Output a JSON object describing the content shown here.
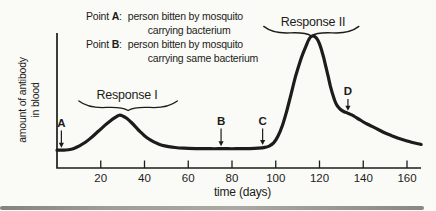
{
  "figure": {
    "background": "#fafaf6",
    "ink": "#1c1c1a"
  },
  "legend": {
    "entries": [
      {
        "prefix": "Point",
        "letter": "A",
        "suffix": ":",
        "line1": "person bitten by mosquito",
        "line2": "carrying bacterium"
      },
      {
        "prefix": "Point",
        "letter": "B",
        "suffix": ":",
        "line1": "person bitten by mosquito",
        "line2": "carrying same bacterium"
      }
    ]
  },
  "chart_data": {
    "type": "line",
    "title": "",
    "xlabel": "time (days)",
    "ylabel": "amount of antibody in blood",
    "ylabel_lines": [
      "amount of antibody",
      "in blood"
    ],
    "x_ticks": [
      20,
      40,
      60,
      80,
      100,
      120,
      140,
      160
    ],
    "xlim": [
      0,
      166
    ],
    "ylim": [
      0,
      105
    ],
    "grid": false,
    "legend_position": "none",
    "series": [
      {
        "name": "antibody level",
        "points": [
          [
            0,
            13.5
          ],
          [
            2,
            13.5
          ],
          [
            4,
            13.6
          ],
          [
            6,
            14
          ],
          [
            8,
            15
          ],
          [
            10,
            16.5
          ],
          [
            13,
            19.5
          ],
          [
            16,
            23.5
          ],
          [
            19,
            28
          ],
          [
            22,
            32.5
          ],
          [
            25,
            36.5
          ],
          [
            27,
            38.8
          ],
          [
            28.5,
            40
          ],
          [
            30,
            39.5
          ],
          [
            32,
            37.5
          ],
          [
            34,
            34.5
          ],
          [
            36,
            31
          ],
          [
            38,
            27.5
          ],
          [
            40,
            24.5
          ],
          [
            42,
            22
          ],
          [
            44,
            20
          ],
          [
            46,
            18.5
          ],
          [
            48,
            17.3
          ],
          [
            51,
            16.2
          ],
          [
            54,
            15.5
          ],
          [
            58,
            15
          ],
          [
            64,
            14.7
          ],
          [
            70,
            14.6
          ],
          [
            76,
            14.6
          ],
          [
            82,
            14.6
          ],
          [
            88,
            14.7
          ],
          [
            92,
            15
          ],
          [
            95,
            15.6
          ],
          [
            97,
            16.6
          ],
          [
            99,
            19
          ],
          [
            101,
            24
          ],
          [
            103,
            32
          ],
          [
            105,
            43
          ],
          [
            107,
            56
          ],
          [
            109,
            69
          ],
          [
            111,
            80
          ],
          [
            112.5,
            87
          ],
          [
            114,
            93
          ],
          [
            115,
            97
          ],
          [
            116,
            99.3
          ],
          [
            117,
            100
          ],
          [
            118,
            99.4
          ],
          [
            119,
            97.5
          ],
          [
            120,
            94
          ],
          [
            121,
            89
          ],
          [
            122,
            83
          ],
          [
            123,
            76
          ],
          [
            124,
            69
          ],
          [
            125,
            62
          ],
          [
            126,
            56
          ],
          [
            127,
            51
          ],
          [
            128,
            47.5
          ],
          [
            129.5,
            44.5
          ],
          [
            131,
            42.8
          ],
          [
            133,
            41.5
          ],
          [
            135,
            40
          ],
          [
            137,
            38
          ],
          [
            139,
            36
          ],
          [
            141,
            34
          ],
          [
            144,
            31.5
          ],
          [
            147,
            29
          ],
          [
            150,
            26.5
          ],
          [
            153,
            24.5
          ],
          [
            156,
            22.5
          ],
          [
            159,
            21
          ],
          [
            162,
            19.5
          ],
          [
            165,
            18.3
          ],
          [
            166.5,
            17.8
          ]
        ]
      }
    ],
    "annotations": {
      "points": [
        {
          "label": "A",
          "day": 2,
          "label_value": 31,
          "target_value": 13.5
        },
        {
          "label": "B",
          "day": 75,
          "label_value": 32.5,
          "target_value": 14.6
        },
        {
          "label": "C",
          "day": 94,
          "label_value": 32.5,
          "target_value": 15.6
        },
        {
          "label": "D",
          "day": 133,
          "label_value": 55,
          "target_value": 41.5
        }
      ],
      "responses": [
        {
          "label": "Response I",
          "day_center": 32,
          "text_value": 52,
          "from_day": 10,
          "to_day": 55,
          "brace_value": 47
        },
        {
          "label": "Response II",
          "day_center": 117,
          "text_value": 107.5,
          "from_day": 94.5,
          "to_day": 138,
          "brace_value": 103.5
        }
      ]
    }
  }
}
